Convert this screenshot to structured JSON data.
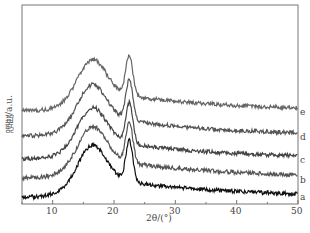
{
  "chart_data": {
    "type": "line",
    "title": "",
    "xlabel": "2θ/(°)",
    "ylabel": "强度/a.u.",
    "xlim": [
      5,
      50
    ],
    "xticks": [
      10,
      20,
      30,
      40,
      50
    ],
    "grid": false,
    "legend": "curve labels at right end",
    "series": [
      {
        "name": "a",
        "offset": 0,
        "x": [
          5,
          10,
          13,
          16,
          19,
          21,
          22.5,
          24,
          27,
          30,
          35,
          40,
          45,
          50
        ],
        "y": [
          0.1,
          0.3,
          0.9,
          1.4,
          1.1,
          1.2,
          1.6,
          0.9,
          0.6,
          0.5,
          0.4,
          0.3,
          0.25,
          0.15
        ]
      },
      {
        "name": "b",
        "offset": 0.9,
        "x": [
          5,
          10,
          13,
          16,
          19,
          21,
          22.5,
          24,
          27,
          30,
          35,
          40,
          45,
          50
        ],
        "y": [
          0.1,
          0.3,
          0.9,
          1.4,
          1.1,
          1.2,
          1.6,
          0.9,
          0.6,
          0.5,
          0.4,
          0.3,
          0.25,
          0.15
        ]
      },
      {
        "name": "c",
        "offset": 1.5,
        "x": [
          5,
          10,
          13,
          16,
          19,
          21,
          22.5,
          24,
          27,
          30,
          35,
          40,
          45,
          50
        ],
        "y": [
          0.1,
          0.3,
          0.9,
          1.4,
          1.1,
          1.2,
          1.6,
          0.9,
          0.6,
          0.5,
          0.4,
          0.3,
          0.25,
          0.15
        ]
      },
      {
        "name": "d",
        "offset": 2.3,
        "x": [
          5,
          10,
          13,
          16,
          19,
          21,
          22.5,
          24,
          27,
          30,
          35,
          40,
          45,
          50
        ],
        "y": [
          0.1,
          0.3,
          0.9,
          1.4,
          1.1,
          1.2,
          1.6,
          0.9,
          0.6,
          0.5,
          0.4,
          0.3,
          0.25,
          0.15
        ]
      },
      {
        "name": "e",
        "offset": 3.1,
        "x": [
          5,
          10,
          13,
          16,
          19,
          21,
          22.5,
          24,
          27,
          30,
          35,
          40,
          45,
          50
        ],
        "y": [
          0.1,
          0.3,
          0.9,
          1.4,
          1.1,
          1.2,
          1.6,
          0.9,
          0.6,
          0.5,
          0.4,
          0.3,
          0.25,
          0.15
        ]
      }
    ]
  },
  "labels": {
    "x": "2θ/(°)",
    "y": "强度/a.u.",
    "ticks": [
      "10",
      "20",
      "30",
      "40",
      "50"
    ],
    "curves": [
      "a",
      "b",
      "c",
      "d",
      "e"
    ]
  }
}
